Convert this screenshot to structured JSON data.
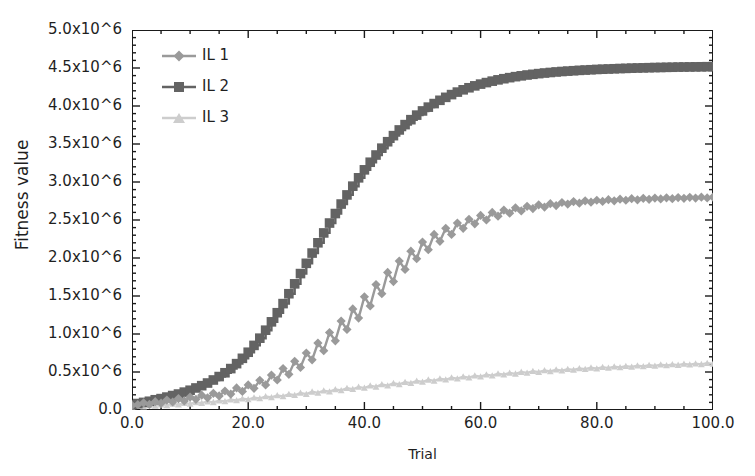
{
  "chart_data": {
    "type": "line",
    "title": "",
    "xlabel": "Trial",
    "ylabel": "Fitness value",
    "xlim": [
      0,
      100
    ],
    "ylim": [
      0,
      5000000
    ],
    "grid": false,
    "legend_position": "top-left-inside",
    "x_tick_labels": [
      "0.0",
      "20.0",
      "40.0",
      "60.0",
      "80.0",
      "100.0"
    ],
    "x_tick_values": [
      0,
      20,
      40,
      60,
      80,
      100
    ],
    "x_minor_tick_interval": 5,
    "y_tick_labels": [
      "0.0",
      "0.5x10^6",
      "1.0x10^6",
      "1.5x10^6",
      "2.0x10^6",
      "2.5x10^6",
      "3.0x10^6",
      "3.5x10^6",
      "4.0x10^6",
      "4.5x10^6",
      "5.0x10^6"
    ],
    "y_tick_values": [
      0,
      500000,
      1000000,
      1500000,
      2000000,
      2500000,
      3000000,
      3500000,
      4000000,
      4500000,
      5000000
    ],
    "y_minor_tick_interval": 100000,
    "x": [
      0,
      1,
      2,
      3,
      4,
      5,
      6,
      7,
      8,
      9,
      10,
      11,
      12,
      13,
      14,
      15,
      16,
      17,
      18,
      19,
      20,
      21,
      22,
      23,
      24,
      25,
      26,
      27,
      28,
      29,
      30,
      31,
      32,
      33,
      34,
      35,
      36,
      37,
      38,
      39,
      40,
      41,
      42,
      43,
      44,
      45,
      46,
      47,
      48,
      49,
      50,
      51,
      52,
      53,
      54,
      55,
      56,
      57,
      58,
      59,
      60,
      61,
      62,
      63,
      64,
      65,
      66,
      67,
      68,
      69,
      70,
      71,
      72,
      73,
      74,
      75,
      76,
      77,
      78,
      79,
      80,
      81,
      82,
      83,
      84,
      85,
      86,
      87,
      88,
      89,
      90,
      91,
      92,
      93,
      94,
      95,
      96,
      97,
      98,
      99,
      100
    ],
    "series": [
      {
        "name": "IL 1",
        "color": "#9a9a9a",
        "marker": "diamond",
        "values": [
          60000,
          70000,
          95000,
          75000,
          110000,
          90000,
          130000,
          105000,
          150000,
          120000,
          170000,
          140000,
          195000,
          160000,
          220000,
          185000,
          250000,
          210000,
          290000,
          245000,
          330000,
          285000,
          390000,
          330000,
          460000,
          395000,
          545000,
          470000,
          640000,
          560000,
          750000,
          660000,
          880000,
          780000,
          1020000,
          910000,
          1170000,
          1060000,
          1330000,
          1210000,
          1490000,
          1370000,
          1650000,
          1530000,
          1810000,
          1690000,
          1960000,
          1850000,
          2090000,
          1990000,
          2210000,
          2110000,
          2310000,
          2220000,
          2390000,
          2310000,
          2460000,
          2390000,
          2510000,
          2450000,
          2560000,
          2500000,
          2600000,
          2550000,
          2630000,
          2590000,
          2660000,
          2620000,
          2680000,
          2650000,
          2700000,
          2670000,
          2715000,
          2690000,
          2730000,
          2710000,
          2742000,
          2722000,
          2752000,
          2734000,
          2760000,
          2744000,
          2768000,
          2752000,
          2774000,
          2760000,
          2780000,
          2766000,
          2785000,
          2772000,
          2789000,
          2777000,
          2792000,
          2781000,
          2795000,
          2785000,
          2798000,
          2788000,
          2800000,
          2791000,
          2802000
        ]
      },
      {
        "name": "IL 2",
        "color": "#636363",
        "marker": "square",
        "values": [
          70000,
          85000,
          100000,
          115000,
          135000,
          150000,
          170000,
          190000,
          210000,
          235000,
          260000,
          290000,
          320000,
          355000,
          395000,
          440000,
          490000,
          545000,
          610000,
          680000,
          760000,
          850000,
          945000,
          1050000,
          1160000,
          1280000,
          1400000,
          1530000,
          1660000,
          1795000,
          1930000,
          2065000,
          2200000,
          2330000,
          2460000,
          2585000,
          2710000,
          2830000,
          2945000,
          3055000,
          3160000,
          3260000,
          3355000,
          3445000,
          3530000,
          3610000,
          3685000,
          3755000,
          3820000,
          3880000,
          3935000,
          3985000,
          4032000,
          4075000,
          4114000,
          4150000,
          4183000,
          4213000,
          4240000,
          4265000,
          4288000,
          4308000,
          4327000,
          4344000,
          4359000,
          4373000,
          4386000,
          4397000,
          4408000,
          4417000,
          4426000,
          4434000,
          4441000,
          4448000,
          4454000,
          4459000,
          4464000,
          4469000,
          4473000,
          4477000,
          4481000,
          4484000,
          4487000,
          4490000,
          4493000,
          4495000,
          4498000,
          4500000,
          4502000,
          4504000,
          4506000,
          4507000,
          4509000,
          4510000,
          4512000,
          4513000,
          4514000,
          4515000,
          4516000,
          4517000,
          4518000
        ]
      },
      {
        "name": "IL 3",
        "color": "#cdcdcd",
        "marker": "triangle",
        "values": [
          40000,
          50000,
          45000,
          60000,
          55000,
          70000,
          62000,
          80000,
          72000,
          90000,
          82000,
          100000,
          92000,
          112000,
          102000,
          124000,
          114000,
          137000,
          126000,
          150000,
          139000,
          164000,
          152000,
          178000,
          166000,
          193000,
          180000,
          208000,
          195000,
          224000,
          210000,
          240000,
          226000,
          256000,
          242000,
          272000,
          258000,
          288000,
          274000,
          304000,
          290000,
          320000,
          306000,
          336000,
          322000,
          352000,
          338000,
          368000,
          354000,
          383000,
          369000,
          398000,
          384000,
          412000,
          399000,
          426000,
          413000,
          440000,
          427000,
          453000,
          440000,
          466000,
          453000,
          478000,
          465000,
          489000,
          477000,
          500000,
          488000,
          511000,
          499000,
          521000,
          509000,
          530000,
          519000,
          539000,
          528000,
          548000,
          537000,
          556000,
          545000,
          564000,
          553000,
          571000,
          560000,
          578000,
          567000,
          584000,
          574000,
          590000,
          580000,
          596000,
          586000,
          601000,
          592000,
          606000,
          597000,
          611000,
          602000,
          616000,
          607000
        ]
      }
    ]
  },
  "legend": {
    "entries": [
      {
        "label": "IL 1"
      },
      {
        "label": "IL 2"
      },
      {
        "label": "IL 3"
      }
    ]
  }
}
